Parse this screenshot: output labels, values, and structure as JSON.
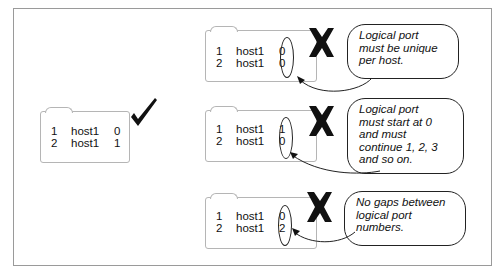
{
  "correct_example": {
    "rows": [
      {
        "index": "1",
        "host": "host1",
        "port": "0"
      },
      {
        "index": "2",
        "host": "host1",
        "port": "1"
      }
    ],
    "mark": "check-mark"
  },
  "incorrect_examples": [
    {
      "rows": [
        {
          "index": "1",
          "host": "host1",
          "port": "0"
        },
        {
          "index": "2",
          "host": "host1",
          "port": "0"
        }
      ],
      "mark": "x-mark",
      "callout": [
        "Logical port",
        "must be unique",
        "per host."
      ]
    },
    {
      "rows": [
        {
          "index": "1",
          "host": "host1",
          "port": "1"
        },
        {
          "index": "2",
          "host": "host1",
          "port": "0"
        }
      ],
      "mark": "x-mark",
      "callout": [
        "Logical port",
        "must start at 0",
        "and must",
        "continue 1, 2, 3",
        "and so on."
      ]
    },
    {
      "rows": [
        {
          "index": "1",
          "host": "host1",
          "port": "0"
        },
        {
          "index": "2",
          "host": "host1",
          "port": "2"
        }
      ],
      "mark": "x-mark",
      "callout": [
        "No gaps between",
        "logical port",
        "numbers."
      ]
    }
  ]
}
